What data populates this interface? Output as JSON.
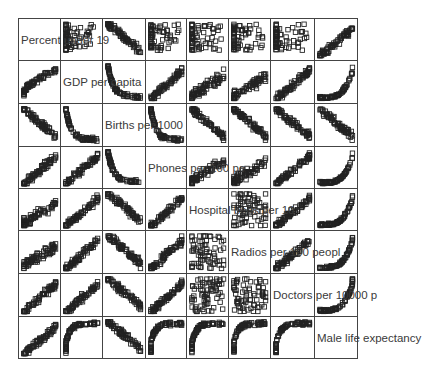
{
  "chart_data": {
    "type": "scatter",
    "subtype": "scatterplot-matrix",
    "title": "",
    "variables": [
      "Percent under 1985",
      "GDP per capita",
      "Births per 1000",
      "Phones per 100 people",
      "Hospital beds per 10000",
      "Radios per 100 people",
      "Doctors per 10000 p",
      "Male life expectancy"
    ],
    "diagonal_labels_as_rendered": [
      "Percent under 19",
      "GDP per capita",
      "Births per 1000",
      "Phones per 100 pe",
      "Hospital beds per 10",
      "Radios per 100 peopl",
      "Doctors per 10000 p",
      "Male life expectancy"
    ],
    "grid": {
      "rows": 8,
      "cols": 8
    },
    "marker": "open-square",
    "axes_ticks": "none",
    "relationships": [
      [
        "diag",
        "vertical-cluster",
        "negative",
        "vertical-cluster",
        "vertical-cluster",
        "vertical-cluster",
        "vertical-cluster",
        "positive"
      ],
      [
        "positive-curve",
        "diag",
        "L-shape",
        "positive",
        "positive-weak",
        "positive-weak",
        "positive",
        "convex-positive"
      ],
      [
        "negative",
        "L-shape",
        "diag",
        "L-shape",
        "negative",
        "negative",
        "negative",
        "negative"
      ],
      [
        "positive",
        "positive",
        "L-shape",
        "diag",
        "positive-weak",
        "positive-weak",
        "positive",
        "convex-positive"
      ],
      [
        "positive-weak",
        "positive",
        "negative",
        "positive",
        "diag",
        "scatter",
        "positive",
        "convex-positive"
      ],
      [
        "positive-weak",
        "positive",
        "negative",
        "positive",
        "scatter",
        "diag",
        "positive",
        "convex-positive"
      ],
      [
        "positive",
        "positive",
        "negative",
        "positive",
        "scatter",
        "scatter",
        "diag",
        "convex-positive"
      ],
      [
        "positive",
        "concave",
        "negative",
        "concave",
        "concave",
        "concave",
        "concave",
        "diag"
      ]
    ]
  }
}
